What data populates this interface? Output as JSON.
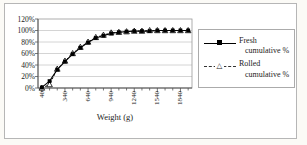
{
  "chart_data": {
    "type": "line",
    "title": "",
    "xlabel": "Weight (g)",
    "ylabel": "",
    "x": [
      40,
      140,
      240,
      340,
      440,
      540,
      640,
      740,
      840,
      940,
      1040,
      1140,
      1240,
      1340,
      1440,
      1540,
      1640,
      1740,
      1840,
      1940
    ],
    "x_tick_labels": [
      "40",
      "340",
      "640",
      "940",
      "1240",
      "1540",
      "1840"
    ],
    "x_tick_indices": [
      0,
      3,
      6,
      9,
      12,
      15,
      18
    ],
    "y_tick_labels_top_down": [
      "120%",
      "100%",
      "80%",
      "60%",
      "40%",
      "20%",
      "0%"
    ],
    "y_grid_values": [
      20,
      40,
      60,
      80,
      100
    ],
    "ylim": [
      0,
      120
    ],
    "grid": "horizontal-only",
    "legend_position": "right",
    "series": [
      {
        "name": "Fresh cumulative %",
        "marker": "filled-square",
        "line": "solid",
        "values": [
          1,
          12,
          32,
          46,
          59,
          70,
          79,
          87,
          91,
          95,
          97,
          98,
          99,
          99,
          99,
          100,
          100,
          100,
          100,
          100
        ]
      },
      {
        "name": "Rolled cumulative %",
        "marker": "open-triangle",
        "line": "dashed",
        "values": [
          0,
          6,
          33,
          47,
          60,
          71,
          80,
          88,
          92,
          96,
          97,
          98,
          99,
          99,
          100,
          100,
          100,
          100,
          100,
          100
        ]
      }
    ]
  },
  "legend": {
    "triangle_glyph": "△"
  },
  "colors": {
    "series_line": "#000000",
    "gridline": "#c9c9c9",
    "plot_border": "#9a9a9a",
    "axis": "#555555",
    "frame_border": "#b6b6b6",
    "background": "#ffffff"
  }
}
